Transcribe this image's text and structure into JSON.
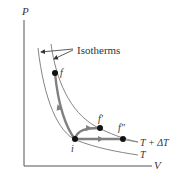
{
  "diagram": {
    "axes": {
      "y_label": "P",
      "x_label": "V"
    },
    "annotation": {
      "label": "Isotherms"
    },
    "isotherms": [
      {
        "label": "T + ΔT",
        "role": "higher-temperature"
      },
      {
        "label": "T",
        "role": "lower-temperature"
      }
    ],
    "points": {
      "initial": "i",
      "final_1": "f",
      "final_2": "f′",
      "final_3": "f″"
    },
    "colors": {
      "background": "#ffffff",
      "axis": "#555555",
      "isotherm": "#777777",
      "path": "#808080",
      "point": "#111111",
      "text": "#333333"
    }
  }
}
